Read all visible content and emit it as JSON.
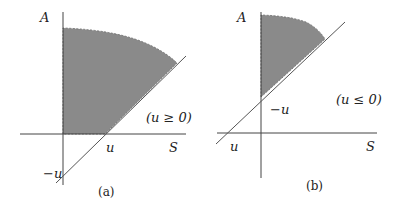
{
  "panels": [
    {
      "id": "a",
      "caption": "(a)",
      "axis_y_label": "A",
      "axis_x_label": "S",
      "condition": "(u ≥ 0)",
      "x_intercept_label": "u",
      "y_intercept_label": "−u"
    },
    {
      "id": "b",
      "caption": "(b)",
      "axis_y_label": "A",
      "axis_x_label": "S",
      "condition": "(u ≤ 0)",
      "x_intercept_label": "u",
      "y_intercept_label": "−u"
    }
  ],
  "colors": {
    "shade": "#8a8a8a",
    "line": "#555555",
    "axis": "#444444"
  }
}
